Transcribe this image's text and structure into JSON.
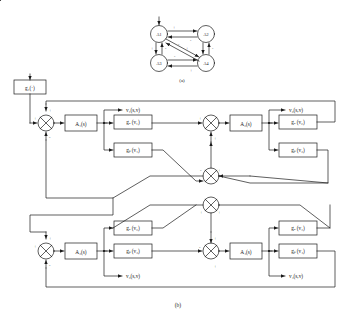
{
  "figure": {
    "caption_a": "(a)",
    "caption_b": "(b)"
  },
  "graph_a": {
    "nodes": [
      {
        "id": "A1",
        "label": "A1"
      },
      {
        "id": "A2",
        "label": "A2"
      },
      {
        "id": "A3",
        "label": "A3"
      },
      {
        "id": "A4",
        "label": "A4"
      }
    ],
    "signs": {
      "a1_a2_out": "+",
      "a2_a1_in": "-",
      "a1_a3_out": "+",
      "a3_a1_in": "-",
      "a2_a4_out": "+",
      "a4_a2_in": "-",
      "a3_a4_out": "-",
      "a4_a3_in": "+",
      "a1_a4_out": "+",
      "a4_a1_in": "-"
    }
  },
  "graph_b": {
    "input_block": "g₁(·)",
    "plants": [
      {
        "id": "A1",
        "label": "A₁(s)"
      },
      {
        "id": "A2",
        "label": "A₂(s)"
      },
      {
        "id": "A3",
        "label": "A₃(s)"
      },
      {
        "id": "A4",
        "label": "A₄(s)"
      }
    ],
    "gains": [
      {
        "id": "ga1",
        "label": "gₐ (v₁)"
      },
      {
        "id": "gb1",
        "label": "gᵦ (v₁)"
      },
      {
        "id": "ga2",
        "label": "gₐ (v₂)"
      },
      {
        "id": "gb2",
        "label": "gᵦ (v₂)"
      },
      {
        "id": "ga3",
        "label": "gₐ (v₃)"
      },
      {
        "id": "gb3",
        "label": "gᵦ (v₃)"
      },
      {
        "id": "ga4",
        "label": "gₐ (v₄)"
      },
      {
        "id": "gb4",
        "label": "gᵦ (v₄)"
      }
    ],
    "outputs": [
      {
        "id": "v1",
        "label": "v₁(s,v)"
      },
      {
        "id": "v2",
        "label": "v₂(s,v)"
      },
      {
        "id": "v3",
        "label": "v₃(s,v)"
      },
      {
        "id": "v4",
        "label": "v₄(s,v)"
      }
    ],
    "sum_signs": {
      "s1_top": "+",
      "s1_left": "+",
      "s1_bottom": "-",
      "s2_top": "+",
      "s2_left": "+",
      "s2_bottom": "+",
      "s3_top": "+",
      "s3_left": "+",
      "s3_bottom": "-",
      "s4_top": "+",
      "s4_left": "-",
      "s4_bottom": "+",
      "m1_left": "-",
      "m1_right": "+",
      "m2_left": "+",
      "m2_right": "+"
    }
  }
}
